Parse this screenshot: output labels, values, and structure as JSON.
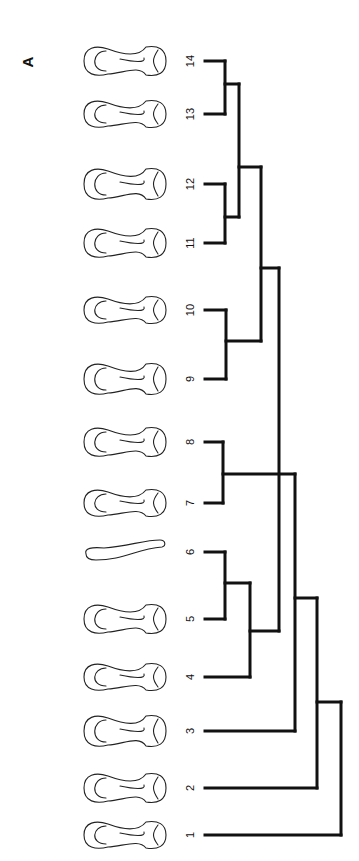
{
  "figure": {
    "panel_label": "A",
    "panel_label_pos": [
      27,
      62
    ],
    "stroke_color": "#111111",
    "background": "#ffffff"
  },
  "leaves": [
    {
      "label": "1",
      "y": 835
    },
    {
      "label": "2",
      "y": 788
    },
    {
      "label": "3",
      "y": 731
    },
    {
      "label": "4",
      "y": 677
    },
    {
      "label": "5",
      "y": 619
    },
    {
      "label": "6",
      "y": 552
    },
    {
      "label": "7",
      "y": 503
    },
    {
      "label": "8",
      "y": 442
    },
    {
      "label": "9",
      "y": 379
    },
    {
      "label": "10",
      "y": 310
    },
    {
      "label": "11",
      "y": 243
    },
    {
      "label": "12",
      "y": 184
    },
    {
      "label": "13",
      "y": 114
    },
    {
      "label": "14",
      "y": 61
    }
  ],
  "label_x": 190,
  "bone_icon": "bone-drawing",
  "dendrogram": {
    "orientation": "rotated, leaves on left, root on right",
    "clusters": [
      {
        "members": [
          "13",
          "14"
        ]
      },
      {
        "members": [
          "11",
          "12"
        ]
      },
      {
        "members": [
          "11",
          "12",
          "13",
          "14"
        ]
      },
      {
        "members": [
          "9",
          "10"
        ]
      },
      {
        "members": [
          "9",
          "10",
          "11",
          "12",
          "13",
          "14"
        ]
      },
      {
        "members": [
          "5",
          "6"
        ]
      },
      {
        "members": [
          "4",
          "5",
          "6"
        ]
      },
      {
        "members": [
          "4",
          "5",
          "6",
          "9",
          "10",
          "11",
          "12",
          "13",
          "14"
        ]
      },
      {
        "members": [
          "7",
          "8"
        ]
      },
      {
        "members": [
          "4",
          "5",
          "6",
          "7",
          "8",
          "9",
          "10",
          "11",
          "12",
          "13",
          "14"
        ]
      },
      {
        "members": [
          "3",
          "4",
          "5",
          "6",
          "7",
          "8",
          "9",
          "10",
          "11",
          "12",
          "13",
          "14"
        ]
      },
      {
        "members": [
          "2",
          "3",
          "4",
          "5",
          "6",
          "7",
          "8",
          "9",
          "10",
          "11",
          "12",
          "13",
          "14"
        ]
      },
      {
        "members": [
          "1",
          "2",
          "3",
          "4",
          "5",
          "6",
          "7",
          "8",
          "9",
          "10",
          "11",
          "12",
          "13",
          "14"
        ]
      }
    ],
    "segments": [
      [
        205,
        61,
        225,
        61
      ],
      [
        205,
        114,
        225,
        114
      ],
      [
        225,
        61,
        225,
        114
      ],
      [
        225,
        84,
        239,
        84
      ],
      [
        205,
        184,
        225,
        184
      ],
      [
        205,
        243,
        225,
        243
      ],
      [
        225,
        184,
        225,
        243
      ],
      [
        225,
        217,
        239,
        217
      ],
      [
        239,
        84,
        239,
        217
      ],
      [
        239,
        167,
        261,
        167
      ],
      [
        205,
        310,
        226,
        310
      ],
      [
        205,
        379,
        226,
        379
      ],
      [
        226,
        310,
        226,
        379
      ],
      [
        226,
        341,
        261,
        341
      ],
      [
        261,
        167,
        261,
        341
      ],
      [
        261,
        268,
        279,
        268
      ],
      [
        205,
        552,
        225,
        552
      ],
      [
        205,
        619,
        225,
        619
      ],
      [
        225,
        552,
        225,
        619
      ],
      [
        225,
        583,
        250,
        583
      ],
      [
        205,
        677,
        250,
        677
      ],
      [
        250,
        583,
        250,
        677
      ],
      [
        250,
        631,
        279,
        631
      ],
      [
        279,
        268,
        279,
        631
      ],
      [
        205,
        442,
        223,
        442
      ],
      [
        205,
        503,
        223,
        503
      ],
      [
        223,
        442,
        223,
        503
      ],
      [
        223,
        474,
        295,
        474
      ],
      [
        205,
        731,
        295,
        731
      ],
      [
        295,
        474,
        295,
        731
      ],
      [
        295,
        598,
        317,
        598
      ],
      [
        205,
        788,
        317,
        788
      ],
      [
        317,
        598,
        317,
        788
      ],
      [
        317,
        702,
        341,
        702
      ],
      [
        205,
        835,
        341,
        835
      ],
      [
        341,
        702,
        341,
        835
      ]
    ]
  }
}
